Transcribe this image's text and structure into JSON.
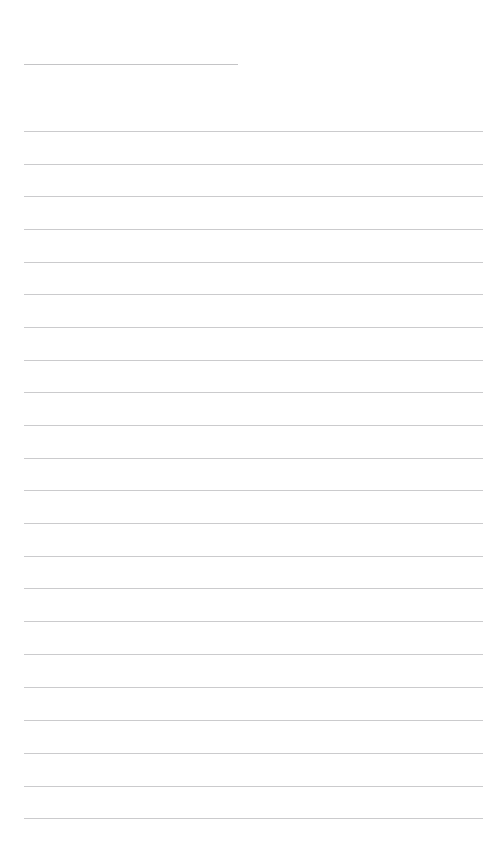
{
  "document": {
    "kind": "lined-paper-template",
    "title_text": "",
    "body_text": "",
    "page_label": "",
    "background_color": "#ffffff",
    "rule_color": "#c9c9cb",
    "title_rule_color": "#c4c4c6",
    "body_rule_color": "#cbcbcd",
    "page_width": 501,
    "page_height": 862
  },
  "title_rule": {
    "name": "title-rule",
    "x": 24,
    "y": 64,
    "width": 214,
    "placeholder": ""
  },
  "body_rules": [
    {
      "index": 1,
      "x": 24,
      "y": 131,
      "width": 459
    },
    {
      "index": 2,
      "x": 24,
      "y": 164,
      "width": 459
    },
    {
      "index": 3,
      "x": 24,
      "y": 196,
      "width": 459
    },
    {
      "index": 4,
      "x": 24,
      "y": 229,
      "width": 459
    },
    {
      "index": 5,
      "x": 24,
      "y": 262,
      "width": 459
    },
    {
      "index": 6,
      "x": 24,
      "y": 294,
      "width": 459
    },
    {
      "index": 7,
      "x": 24,
      "y": 327,
      "width": 459
    },
    {
      "index": 8,
      "x": 24,
      "y": 360,
      "width": 459
    },
    {
      "index": 9,
      "x": 24,
      "y": 392,
      "width": 459
    },
    {
      "index": 10,
      "x": 24,
      "y": 425,
      "width": 459
    },
    {
      "index": 11,
      "x": 24,
      "y": 458,
      "width": 459
    },
    {
      "index": 12,
      "x": 24,
      "y": 490,
      "width": 459
    },
    {
      "index": 13,
      "x": 24,
      "y": 523,
      "width": 459
    },
    {
      "index": 14,
      "x": 24,
      "y": 556,
      "width": 459
    },
    {
      "index": 15,
      "x": 24,
      "y": 588,
      "width": 459
    },
    {
      "index": 16,
      "x": 24,
      "y": 621,
      "width": 459
    },
    {
      "index": 17,
      "x": 24,
      "y": 654,
      "width": 459
    },
    {
      "index": 18,
      "x": 24,
      "y": 687,
      "width": 459
    },
    {
      "index": 19,
      "x": 24,
      "y": 720,
      "width": 459
    },
    {
      "index": 20,
      "x": 24,
      "y": 753,
      "width": 459
    },
    {
      "index": 21,
      "x": 24,
      "y": 786,
      "width": 459
    },
    {
      "index": 22,
      "x": 24,
      "y": 818,
      "width": 459
    }
  ],
  "line_values": [
    "",
    "",
    "",
    "",
    "",
    "",
    "",
    "",
    "",
    "",
    "",
    "",
    "",
    "",
    "",
    "",
    "",
    "",
    "",
    "",
    "",
    ""
  ]
}
